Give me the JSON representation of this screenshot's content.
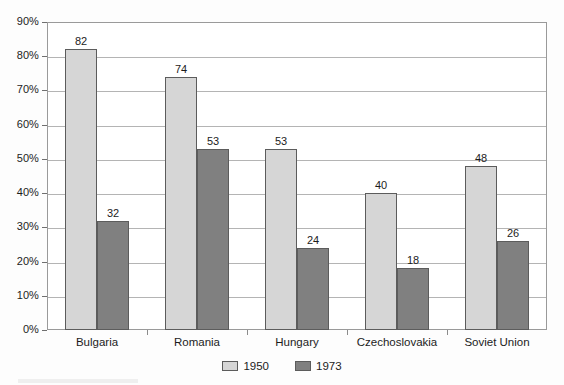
{
  "chart_data": {
    "type": "bar",
    "title": "",
    "subtitle": "",
    "xlabel": "",
    "ylabel": "",
    "categories": [
      "Bulgaria",
      "Romania",
      "Hungary",
      "Czechoslovakia",
      "Soviet Union"
    ],
    "series": [
      {
        "name": "1950",
        "color": "#d6d6d6",
        "values": [
          82,
          74,
          53,
          40,
          48
        ]
      },
      {
        "name": "1973",
        "color": "#808080",
        "values": [
          32,
          53,
          24,
          18,
          26
        ]
      }
    ],
    "value_labels": {
      "1950": [
        "82",
        "74",
        "53",
        "40",
        "48"
      ],
      "1973": [
        "32",
        "53",
        "24",
        "18",
        "26"
      ]
    },
    "ylim": [
      0,
      90
    ],
    "ytick_values": [
      0,
      10,
      20,
      30,
      40,
      50,
      60,
      70,
      80,
      90
    ],
    "ytick_labels": [
      "0%",
      "10%",
      "20%",
      "30%",
      "40%",
      "50%",
      "60%",
      "70%",
      "80%",
      "90%"
    ],
    "grid": "horizontal",
    "legend_position": "bottom-center",
    "legend_entries": [
      "1950",
      "1973"
    ],
    "annotations": [],
    "data_labels_shown": true
  },
  "axes": {
    "y": {
      "ticks": [
        {
          "label": "90%",
          "value": 90
        },
        {
          "label": "80%",
          "value": 80
        },
        {
          "label": "70%",
          "value": 70
        },
        {
          "label": "60%",
          "value": 60
        },
        {
          "label": "50%",
          "value": 50
        },
        {
          "label": "40%",
          "value": 40
        },
        {
          "label": "30%",
          "value": 30
        },
        {
          "label": "20%",
          "value": 20
        },
        {
          "label": "10%",
          "value": 10
        },
        {
          "label": "0%",
          "value": 0
        }
      ]
    },
    "x": {
      "categories": [
        {
          "label": "Bulgaria"
        },
        {
          "label": "Romania"
        },
        {
          "label": "Hungary"
        },
        {
          "label": "Czechoslovakia"
        },
        {
          "label": "Soviet Union"
        }
      ]
    }
  },
  "legend": {
    "items": [
      {
        "label": "1950",
        "color": "#d6d6d6"
      },
      {
        "label": "1973",
        "color": "#808080"
      }
    ]
  },
  "colors": {
    "series_1950": "#d6d6d6",
    "series_1973": "#808080",
    "gridline": "#b4b4b4",
    "frame": "#9a9a9a",
    "text": "#1c1c1c"
  }
}
